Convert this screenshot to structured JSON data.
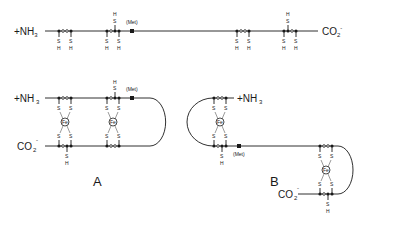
{
  "figure": {
    "top": {
      "n_terminus": "+NH",
      "n_sub": "3",
      "c_terminus": "CO",
      "c_sub": "2",
      "c_sup": "-",
      "met_label": "(Met)",
      "sh_s": "S",
      "sh_h": "H"
    },
    "panel_a": {
      "label": "A",
      "n_terminus": "+NH",
      "n_sub": "3",
      "c_terminus": "CO",
      "c_sub": "2",
      "c_sup": "-",
      "met_label": "(Met)",
      "fe_label": "Fe",
      "s_label": "S",
      "h_label": "H"
    },
    "panel_b": {
      "label": "B",
      "n_terminus": "+NH",
      "n_sub": "3",
      "c_terminus": "CO",
      "c_sub": "2",
      "c_sup": "-",
      "met_label": "(Met)",
      "fe_label": "Fe",
      "s_label": "S",
      "h_label": "H"
    }
  }
}
